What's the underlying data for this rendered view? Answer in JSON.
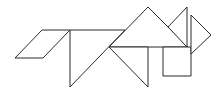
{
  "figure": {
    "type": "tangram",
    "background": "#ffffff",
    "stroke_color": "#2b2b2b",
    "stroke_width": 1,
    "pieces": [
      {
        "name": "parallelogram",
        "points": "15,58 42,30 70,30 43,58"
      },
      {
        "name": "large-triangle-body",
        "points": "70,30 125,30 70,87"
      },
      {
        "name": "large-triangle-head",
        "points": "109,47 148,7 188,47"
      },
      {
        "name": "medium-triangle-chest",
        "points": "109,47 148,47 148,87"
      },
      {
        "name": "square",
        "points": "163,47 191,47 191,76 163,76"
      },
      {
        "name": "small-triangle-ear",
        "points": "187,7 168,27 187,47"
      },
      {
        "name": "small-triangle-snout",
        "points": "191,15 211,35 191,54"
      }
    ]
  }
}
